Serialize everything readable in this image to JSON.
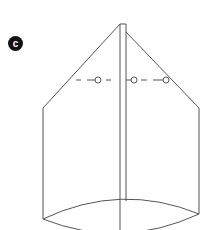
{
  "figure": {
    "label": "c",
    "colors": {
      "stroke": "#555555",
      "badge": "#111111"
    }
  }
}
